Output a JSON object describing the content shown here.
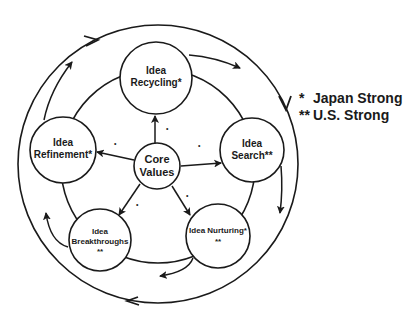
{
  "diagram": {
    "center_node": {
      "line1": "Core",
      "line2": "Values"
    },
    "nodes": [
      {
        "id": "recycling",
        "line1": "Idea",
        "line2": "Recycling*",
        "line3": ""
      },
      {
        "id": "search",
        "line1": "Idea",
        "line2": "Search**",
        "line3": ""
      },
      {
        "id": "nurturing",
        "line1": "Idea Nurturing*",
        "line2": "**",
        "line3": ""
      },
      {
        "id": "breakthroughs",
        "line1": "Idea",
        "line2": "Breakthroughs",
        "line3": "**"
      },
      {
        "id": "refinement",
        "line1": "Idea",
        "line2": "Refinement*",
        "line3": ""
      }
    ],
    "legend": [
      {
        "marker": "*",
        "label": "Japan Strong"
      },
      {
        "marker": "**",
        "label": "U.S. Strong"
      }
    ],
    "colors": {
      "stroke": "#1a1a1a",
      "background": "#ffffff"
    }
  }
}
